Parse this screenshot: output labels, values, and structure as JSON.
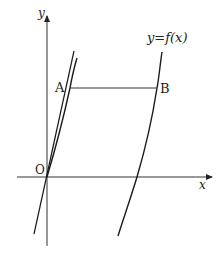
{
  "diagram": {
    "type": "function-graph",
    "axes": {
      "x_label": "x",
      "y_label": "y",
      "origin_label": "O"
    },
    "curve_label": "y=f(x)",
    "points": [
      {
        "name": "A",
        "label": "A"
      },
      {
        "name": "B",
        "label": "B"
      }
    ],
    "segments": [
      {
        "from": "A",
        "to": "B",
        "orientation": "horizontal"
      }
    ],
    "elements": [
      "y-axis with arrow",
      "x-axis with arrow",
      "left branch of y=f(x) passing through O",
      "tangent line at O",
      "right branch of y=f(x)",
      "horizontal segment AB"
    ],
    "colors": {
      "stroke": "#1a1a1a",
      "axis": "#333333"
    }
  }
}
